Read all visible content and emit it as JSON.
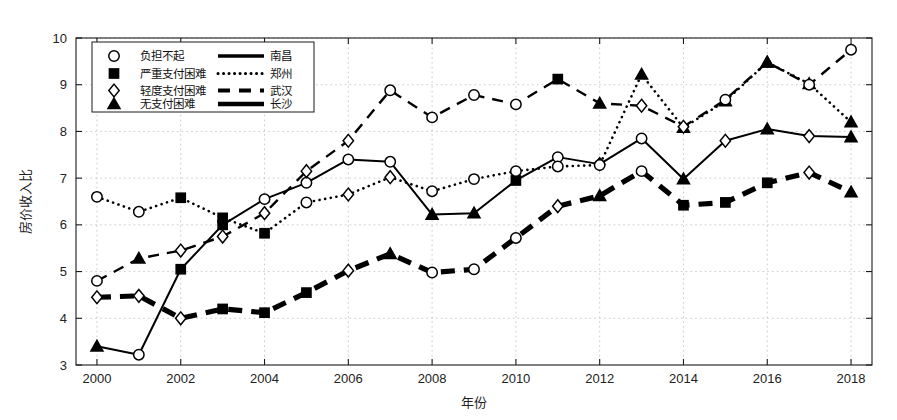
{
  "chart_data": {
    "type": "line",
    "title": "",
    "xlabel": "年份",
    "ylabel": "房价收入比",
    "xlim": [
      1999.5,
      2018.5
    ],
    "ylim": [
      3,
      10
    ],
    "grid": true,
    "x": [
      2000,
      2001,
      2002,
      2003,
      2004,
      2005,
      2006,
      2007,
      2008,
      2009,
      2010,
      2011,
      2012,
      2013,
      2014,
      2015,
      2016,
      2017,
      2018
    ],
    "xticks": [
      2000,
      2002,
      2004,
      2006,
      2008,
      2010,
      2012,
      2014,
      2016,
      2018
    ],
    "yticks": [
      3,
      4,
      5,
      6,
      7,
      8,
      9,
      10
    ],
    "legend_position": "upper-left-inside",
    "marker_legend": [
      {
        "marker": "circle-open",
        "label": "负担不起"
      },
      {
        "marker": "square-filled",
        "label": "严重支付困难"
      },
      {
        "marker": "diamond-open",
        "label": "轻度支付困难"
      },
      {
        "marker": "triangle-filled",
        "label": "无支付困难"
      }
    ],
    "line_legend": [
      {
        "style": "solid",
        "label": "南昌"
      },
      {
        "style": "dotted",
        "label": "郑州"
      },
      {
        "style": "dashed",
        "label": "武汉"
      },
      {
        "style": "thick-solid",
        "label": "长沙"
      }
    ],
    "series": [
      {
        "name": "南昌",
        "style": "solid",
        "values": [
          3.4,
          3.22,
          5.05,
          6.0,
          6.55,
          6.9,
          7.4,
          7.35,
          6.22,
          6.25,
          6.95,
          7.45,
          7.3,
          7.85,
          6.98,
          7.8,
          8.05,
          7.9,
          7.88
        ],
        "markers": [
          "triangle-filled",
          "circle-open",
          "square-filled",
          "square-filled",
          "circle-open",
          "circle-open",
          "circle-open",
          "circle-open",
          "triangle-filled",
          "triangle-filled",
          "square-filled",
          "circle-open",
          "diamond-open",
          "circle-open",
          "triangle-filled",
          "diamond-open",
          "triangle-filled",
          "diamond-open",
          "triangle-filled"
        ]
      },
      {
        "name": "郑州",
        "style": "dotted",
        "values": [
          6.6,
          6.28,
          6.58,
          6.15,
          5.82,
          6.48,
          6.65,
          7.02,
          6.72,
          6.98,
          7.15,
          7.25,
          7.28,
          9.22,
          8.08,
          8.65,
          9.48,
          9.02,
          8.2
        ],
        "markers": [
          "circle-open",
          "circle-open",
          "square-filled",
          "square-filled",
          "square-filled",
          "circle-open",
          "diamond-open",
          "diamond-open",
          "circle-open",
          "circle-open",
          "circle-open",
          "circle-open",
          "circle-open",
          "triangle-filled",
          "triangle-filled",
          "triangle-filled",
          "triangle-filled",
          "triangle-filled",
          "triangle-filled"
        ]
      },
      {
        "name": "武汉",
        "style": "dashed",
        "values": [
          4.8,
          5.28,
          5.45,
          5.75,
          6.25,
          7.15,
          7.8,
          8.88,
          8.3,
          8.78,
          8.58,
          9.12,
          8.6,
          8.55,
          8.1,
          8.68,
          9.48,
          9.0,
          9.75
        ],
        "markers": [
          "circle-open",
          "triangle-filled",
          "diamond-open",
          "diamond-open",
          "diamond-open",
          "diamond-open",
          "diamond-open",
          "circle-open",
          "circle-open",
          "circle-open",
          "circle-open",
          "square-filled",
          "triangle-filled",
          "diamond-open",
          "diamond-open",
          "circle-open",
          "triangle-filled",
          "circle-open",
          "circle-open"
        ]
      },
      {
        "name": "长沙",
        "style": "thick-solid",
        "values": [
          4.45,
          4.48,
          4.0,
          4.2,
          4.12,
          4.55,
          5.02,
          5.38,
          4.98,
          5.05,
          5.72,
          6.4,
          6.62,
          7.15,
          6.42,
          6.48,
          6.9,
          7.12,
          6.7
        ],
        "markers": [
          "diamond-open",
          "diamond-open",
          "diamond-open",
          "square-filled",
          "square-filled",
          "square-filled",
          "diamond-open",
          "triangle-filled",
          "circle-open",
          "circle-open",
          "circle-open",
          "diamond-open",
          "triangle-filled",
          "circle-open",
          "square-filled",
          "square-filled",
          "square-filled",
          "diamond-open",
          "triangle-filled"
        ]
      }
    ]
  }
}
